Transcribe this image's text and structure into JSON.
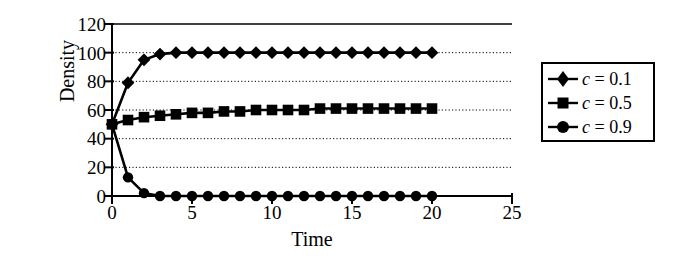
{
  "chart_data": {
    "type": "line",
    "title": "",
    "xlabel": "Time",
    "ylabel": "Density",
    "xlim": [
      0,
      25
    ],
    "ylim": [
      0,
      120
    ],
    "xticks": [
      "0",
      "5",
      "10",
      "15",
      "20",
      "25"
    ],
    "yticks": [
      "0",
      "20",
      "40",
      "60",
      "80",
      "100",
      "120"
    ],
    "xtick_values": [
      0,
      5,
      10,
      15,
      20,
      25
    ],
    "ytick_values": [
      0,
      20,
      40,
      60,
      80,
      100,
      120
    ],
    "grid": "horizontal-dotted",
    "legend_position": "right-outside",
    "x": [
      0,
      1,
      2,
      3,
      4,
      5,
      6,
      7,
      8,
      9,
      10,
      11,
      12,
      13,
      14,
      15,
      16,
      17,
      18,
      19,
      20
    ],
    "series": [
      {
        "name": "c = 0.1",
        "marker": "diamond",
        "color": "#000000",
        "values": [
          50,
          79,
          95,
          99,
          100,
          100,
          100,
          100,
          100,
          100,
          100,
          100,
          100,
          100,
          100,
          100,
          100,
          100,
          100,
          100,
          100
        ]
      },
      {
        "name": "c = 0.5",
        "marker": "square",
        "color": "#000000",
        "values": [
          50,
          53,
          55,
          56,
          57,
          58,
          58,
          59,
          59,
          60,
          60,
          60,
          60,
          61,
          61,
          61,
          61,
          61,
          61,
          61,
          61
        ]
      },
      {
        "name": "c = 0.9",
        "marker": "circle",
        "color": "#000000",
        "values": [
          50,
          13,
          2,
          0,
          0,
          0,
          0,
          0,
          0,
          0,
          0,
          0,
          0,
          0,
          0,
          0,
          0,
          0,
          0,
          0,
          0
        ]
      }
    ]
  },
  "axes": {
    "ylabel": "Density",
    "xlabel": "Time",
    "ytick_labels": [
      "120",
      "100",
      "80",
      "60",
      "40",
      "20",
      "0"
    ],
    "xtick_labels": [
      "0",
      "5",
      "10",
      "15",
      "20",
      "25"
    ]
  },
  "legend": {
    "entries": [
      {
        "variable": "c",
        "equals": "=",
        "value": "0.1",
        "marker": "diamond-marker"
      },
      {
        "variable": "c",
        "equals": "=",
        "value": "0.5",
        "marker": "square-marker"
      },
      {
        "variable": "c",
        "equals": "=",
        "value": "0.9",
        "marker": "circle-marker"
      }
    ]
  }
}
